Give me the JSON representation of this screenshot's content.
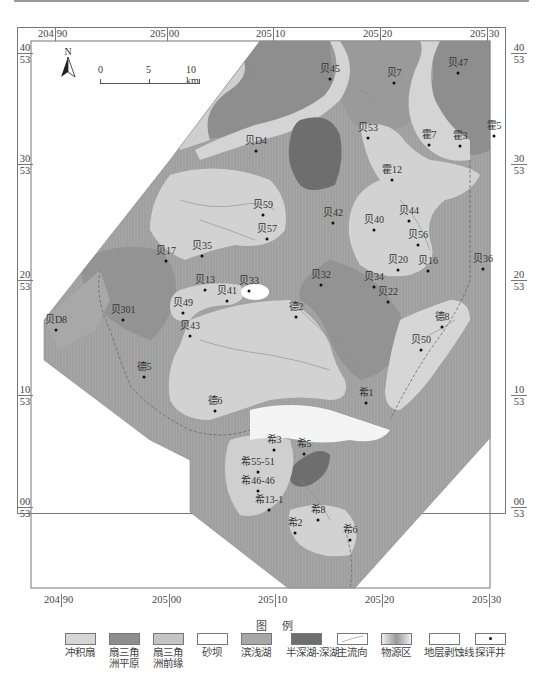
{
  "figure": {
    "type": "sedimentary-facies-map",
    "grid": {
      "x_ticks": [
        {
          "major": "204",
          "minor": "90"
        },
        {
          "major": "205",
          "minor": "00"
        },
        {
          "major": "205",
          "minor": "10"
        },
        {
          "major": "205",
          "minor": "20"
        },
        {
          "major": "205",
          "minor": "30"
        }
      ],
      "y_ticks": [
        {
          "minor": "40",
          "major": "53"
        },
        {
          "minor": "30",
          "major": "53"
        },
        {
          "minor": "20",
          "major": "53"
        },
        {
          "minor": "10",
          "major": "53"
        },
        {
          "minor": "00",
          "major": "53"
        }
      ]
    },
    "north_arrow": {
      "label": "N"
    },
    "scale_bar": {
      "labels": [
        "0",
        "5",
        "10 km"
      ]
    },
    "colors": {
      "alluvial_fan": "#d6d6d6",
      "fan_delta_plain": "#8e8e8e",
      "fan_delta_front": "#c4c4c4",
      "sand_bar": "#ffffff",
      "shore_shallow_lake": "#a8a8a8",
      "semi_deep_deep_lake": "#6e6e6e",
      "source_area": "#b2b2b2",
      "frame": "#777777"
    },
    "wells": [
      {
        "name": "贝45",
        "x": 330,
        "y": 77
      },
      {
        "name": "贝7",
        "x": 394,
        "y": 81
      },
      {
        "name": "贝47",
        "x": 458,
        "y": 71
      },
      {
        "name": "贝53",
        "x": 368,
        "y": 136
      },
      {
        "name": "霍7",
        "x": 429,
        "y": 143
      },
      {
        "name": "霍3",
        "x": 460,
        "y": 144
      },
      {
        "name": "霍5",
        "x": 494,
        "y": 134
      },
      {
        "name": "贝D4",
        "x": 256,
        "y": 149
      },
      {
        "name": "霍12",
        "x": 392,
        "y": 178
      },
      {
        "name": "贝59",
        "x": 263,
        "y": 213
      },
      {
        "name": "贝42",
        "x": 333,
        "y": 221
      },
      {
        "name": "贝40",
        "x": 374,
        "y": 228
      },
      {
        "name": "贝44",
        "x": 409,
        "y": 219
      },
      {
        "name": "贝57",
        "x": 267,
        "y": 237
      },
      {
        "name": "贝56",
        "x": 418,
        "y": 243
      },
      {
        "name": "贝35",
        "x": 202,
        "y": 254
      },
      {
        "name": "贝17",
        "x": 166,
        "y": 259
      },
      {
        "name": "贝20",
        "x": 398,
        "y": 268
      },
      {
        "name": "贝16",
        "x": 428,
        "y": 269
      },
      {
        "name": "贝36",
        "x": 483,
        "y": 267
      },
      {
        "name": "贝33",
        "x": 249,
        "y": 289
      },
      {
        "name": "贝32",
        "x": 321,
        "y": 283
      },
      {
        "name": "贝34",
        "x": 374,
        "y": 285
      },
      {
        "name": "贝13",
        "x": 205,
        "y": 288
      },
      {
        "name": "贝41",
        "x": 227,
        "y": 299
      },
      {
        "name": "贝22",
        "x": 388,
        "y": 300
      },
      {
        "name": "德2",
        "x": 296,
        "y": 315
      },
      {
        "name": "贝49",
        "x": 183,
        "y": 311
      },
      {
        "name": "贝301",
        "x": 123,
        "y": 318
      },
      {
        "name": "贝D8",
        "x": 56,
        "y": 328
      },
      {
        "name": "德8",
        "x": 442,
        "y": 325
      },
      {
        "name": "贝43",
        "x": 190,
        "y": 334
      },
      {
        "name": "贝50",
        "x": 421,
        "y": 348
      },
      {
        "name": "德5",
        "x": 144,
        "y": 375
      },
      {
        "name": "希1",
        "x": 366,
        "y": 401
      },
      {
        "name": "德6",
        "x": 215,
        "y": 409
      },
      {
        "name": "希3",
        "x": 274,
        "y": 448
      },
      {
        "name": "希5",
        "x": 304,
        "y": 452
      },
      {
        "name": "希55-51",
        "x": 258,
        "y": 470
      },
      {
        "name": "希46-46",
        "x": 258,
        "y": 489
      },
      {
        "name": "希13-1",
        "x": 269,
        "y": 508
      },
      {
        "name": "希8",
        "x": 318,
        "y": 518
      },
      {
        "name": "希2",
        "x": 295,
        "y": 531
      },
      {
        "name": "希6",
        "x": 350,
        "y": 538
      }
    ]
  },
  "legend": {
    "title": "图 例",
    "items": [
      {
        "key": "alluvial_fan",
        "label_lines": [
          "冲积扇"
        ]
      },
      {
        "key": "fan_delta_plain",
        "label_lines": [
          "扇三角",
          "洲平原"
        ]
      },
      {
        "key": "fan_delta_front",
        "label_lines": [
          "扇三角",
          "洲前缘"
        ]
      },
      {
        "key": "sand_bar",
        "label_lines": [
          "砂坝"
        ]
      },
      {
        "key": "shore_shallow_lake",
        "label_lines": [
          "滨浅湖"
        ]
      },
      {
        "key": "semi_deep_deep_lake",
        "label_lines": [
          "半深湖-深湖"
        ]
      },
      {
        "key": "main_flow",
        "label_lines": [
          "主流向"
        ]
      },
      {
        "key": "source_area",
        "label_lines": [
          "物源区"
        ]
      },
      {
        "key": "erosion_line",
        "label_lines": [
          "地层剥蚀线"
        ]
      },
      {
        "key": "exploration_well",
        "label_lines": [
          "探评井"
        ]
      }
    ]
  }
}
